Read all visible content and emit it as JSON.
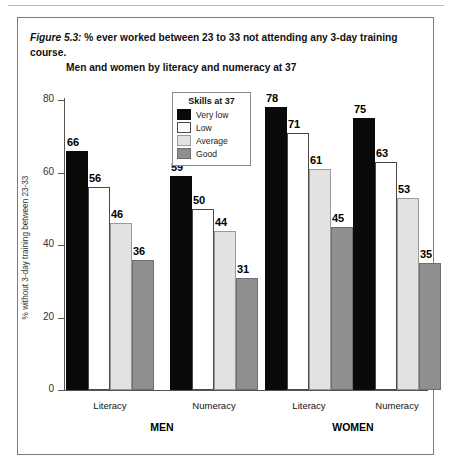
{
  "figure": {
    "number": "Figure 5.3:",
    "title_line1": " % ever worked between 23 to 33 not attending any 3-day training course.",
    "title_line2": "Men and women by literacy and numeracy at 37"
  },
  "legend": {
    "title": "Skills at 37",
    "items": [
      {
        "label": "Very low",
        "color": "#0a0a0a",
        "key": "verylow"
      },
      {
        "label": "Low",
        "color": "#ffffff",
        "key": "low"
      },
      {
        "label": "Average",
        "color": "#e2e2e2",
        "key": "average"
      },
      {
        "label": "Good",
        "color": "#8f8f8f",
        "key": "good"
      }
    ]
  },
  "chart_data": {
    "type": "bar",
    "title": "Figure 5.3: % ever worked between 23 to 33 not attending any 3-day training course. Men and women by literacy and numeracy at 37",
    "xlabel": "",
    "ylabel": "% without 3-day training between 23-33",
    "ylim": [
      0,
      80
    ],
    "yticks": [
      0,
      20,
      40,
      60,
      80
    ],
    "ytick_labels": [
      "0",
      "20",
      "40",
      "60",
      "80"
    ],
    "grid": false,
    "legend_position": "inside-top-center",
    "legend_title": "Skills at 37",
    "categories": [
      "MEN / Literacy",
      "MEN / Numeracy",
      "WOMEN / Literacy",
      "WOMEN / Numeracy"
    ],
    "supergroups": [
      "MEN",
      "WOMEN"
    ],
    "subgroups": [
      "Literacy",
      "Numeracy",
      "Literacy",
      "Numeracy"
    ],
    "series": [
      {
        "name": "Very low",
        "color": "#0a0a0a",
        "values": [
          66,
          59,
          78,
          75
        ]
      },
      {
        "name": "Low",
        "color": "#ffffff",
        "values": [
          56,
          50,
          71,
          63
        ]
      },
      {
        "name": "Average",
        "color": "#e2e2e2",
        "values": [
          46,
          44,
          61,
          53
        ]
      },
      {
        "name": "Good",
        "color": "#8f8f8f",
        "values": [
          36,
          31,
          45,
          35
        ]
      }
    ]
  }
}
